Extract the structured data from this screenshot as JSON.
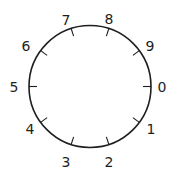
{
  "diagram": {
    "type": "circular-dial",
    "center": [
      90,
      86.5
    ],
    "radius": 61,
    "tick_length": 8,
    "stroke_color": "#1e1e1e",
    "label_color": "#1e1e1e",
    "background": "#ffffff",
    "divisions": 10,
    "direction": "clockwise from right",
    "labels": [
      {
        "text": "0",
        "angle_deg": 0,
        "x": 162,
        "y": 87
      },
      {
        "text": "1",
        "angle_deg": 36,
        "x": 151,
        "y": 129
      },
      {
        "text": "2",
        "angle_deg": 72,
        "x": 109,
        "y": 162
      },
      {
        "text": "3",
        "angle_deg": 108,
        "x": 66,
        "y": 162
      },
      {
        "text": "4",
        "angle_deg": 144,
        "x": 30,
        "y": 129
      },
      {
        "text": "5",
        "angle_deg": 180,
        "x": 14,
        "y": 87
      },
      {
        "text": "6",
        "angle_deg": 216,
        "x": 26,
        "y": 46
      },
      {
        "text": "7",
        "angle_deg": 252,
        "x": 66,
        "y": 20
      },
      {
        "text": "8",
        "angle_deg": 288,
        "x": 109,
        "y": 19
      },
      {
        "text": "9",
        "angle_deg": 324,
        "x": 150,
        "y": 46
      }
    ]
  }
}
